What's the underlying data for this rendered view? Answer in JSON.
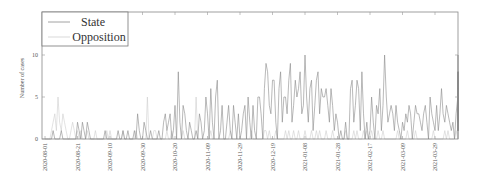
{
  "chart_data": {
    "type": "line",
    "title": "",
    "xlabel": "",
    "ylabel": "Number of cases",
    "ylim": [
      0,
      15
    ],
    "yticks": [
      0,
      5,
      10
    ],
    "grid": false,
    "legend_position": "upper left",
    "x_start": "2020-08-01",
    "x_end": "2021-04-13",
    "xtick_labels": [
      "2020-08-01",
      "2020-08-21",
      "2020-09-10",
      "2020-09-30",
      "2020-10-20",
      "2020-11-09",
      "2020-11-29",
      "2020-12-19",
      "2021-01-08",
      "2021-01-28",
      "2021-02-17",
      "2021-03-09",
      "2021-03-29"
    ],
    "series": [
      {
        "name": "State",
        "color": "#8a8a8a",
        "values": [
          0,
          0,
          0,
          0,
          0,
          1,
          0,
          0,
          0,
          0,
          1,
          0,
          0,
          0,
          0,
          0,
          0,
          0,
          0,
          0,
          2,
          1,
          0,
          2,
          1,
          0,
          2,
          1,
          0,
          0,
          0,
          0,
          0,
          0,
          0,
          0,
          0,
          1,
          0,
          0,
          0,
          0,
          0,
          0,
          0,
          1,
          0,
          0,
          1,
          0,
          0,
          1,
          0,
          0,
          0,
          1,
          0,
          3,
          1,
          0,
          0,
          2,
          1,
          0,
          0,
          1,
          0,
          0,
          0,
          0,
          1,
          0,
          0,
          2,
          3,
          1,
          2,
          3,
          0,
          1,
          4,
          0,
          8,
          2,
          0,
          4,
          3,
          1,
          0,
          2,
          1,
          0,
          0,
          1,
          0,
          3,
          2,
          0,
          1,
          5,
          3,
          0,
          6,
          2,
          0,
          5,
          7,
          0,
          1,
          4,
          0,
          0,
          2,
          4,
          1,
          0,
          4,
          2,
          0,
          3,
          0,
          1,
          3,
          4,
          0,
          5,
          2,
          0,
          4,
          1,
          0,
          5,
          5,
          3,
          0,
          6,
          9,
          8,
          4,
          3,
          7,
          7,
          2,
          0,
          6,
          8,
          2,
          5,
          5,
          3,
          7,
          9,
          2,
          4,
          7,
          5,
          6,
          8,
          3,
          4,
          10,
          5,
          2,
          6,
          7,
          1,
          4,
          7,
          8,
          3,
          6,
          5,
          5,
          6,
          4,
          2,
          6,
          4,
          1,
          3,
          2,
          0,
          1,
          0,
          0,
          2,
          0,
          0,
          6,
          7,
          2,
          4,
          7,
          6,
          1,
          8,
          3,
          0,
          2,
          0,
          1,
          5,
          2,
          0,
          4,
          3,
          6,
          1,
          4,
          10,
          5,
          2,
          3,
          4,
          3,
          1,
          4,
          2,
          1,
          0,
          2,
          1,
          3,
          2,
          4,
          3,
          0,
          2,
          4,
          3,
          3,
          2,
          1,
          3,
          4,
          2,
          0,
          5,
          3,
          2,
          1,
          4,
          1,
          3,
          6,
          3,
          2,
          4,
          3,
          2,
          1,
          2,
          0,
          3,
          5,
          4,
          3,
          1,
          7,
          10,
          2,
          8,
          4,
          1,
          6,
          5,
          7,
          1,
          4,
          8,
          2,
          1,
          7,
          4,
          2,
          6,
          8,
          2,
          5
        ],
        "notes": "Daily counts, approximate reading; darker gray line"
      },
      {
        "name": "Opposition",
        "color": "#cfcfcf",
        "values": [
          0,
          0,
          0,
          0,
          1,
          2,
          3,
          1,
          5,
          2,
          1,
          3,
          2,
          1,
          0,
          0,
          1,
          2,
          1,
          0,
          1,
          0,
          1,
          0,
          0,
          0,
          1,
          0,
          0,
          0,
          0,
          1,
          0,
          0,
          0,
          0,
          0,
          0,
          1,
          0,
          1,
          0,
          0,
          0,
          0,
          0,
          0,
          0,
          1,
          0,
          0,
          0,
          0,
          0,
          0,
          0,
          1,
          0,
          0,
          0,
          0,
          0,
          0,
          5,
          0,
          0,
          0,
          1,
          1,
          0,
          0,
          0,
          0,
          0,
          0,
          1,
          0,
          0,
          1,
          0,
          0,
          0,
          0,
          0,
          0,
          1,
          0,
          0,
          0,
          0,
          0,
          0,
          0,
          5,
          0,
          0,
          0,
          0,
          0,
          0,
          0,
          0,
          1,
          0,
          0,
          0,
          0,
          0,
          0,
          0,
          0,
          0,
          0,
          0,
          1,
          0,
          0,
          0,
          0,
          0,
          0,
          0,
          0,
          0,
          0,
          0,
          0,
          1,
          0,
          0,
          0,
          0,
          0,
          0,
          0,
          1,
          1,
          0,
          1,
          0,
          0,
          0,
          1,
          0,
          0,
          0,
          0,
          0,
          1,
          0,
          1,
          0,
          0,
          1,
          0,
          0,
          1,
          0,
          0,
          0,
          1,
          0,
          0,
          0,
          1,
          0,
          0,
          1,
          0,
          1,
          0,
          0,
          0,
          1,
          0,
          0,
          0,
          1,
          0,
          0,
          0,
          0,
          0,
          0,
          0,
          1,
          0,
          0,
          0,
          0,
          1,
          0,
          1,
          0,
          0,
          0,
          1,
          0,
          1,
          0,
          0,
          1,
          0,
          0,
          0,
          1,
          0,
          0,
          1,
          0,
          0,
          0,
          0,
          0,
          0,
          0,
          0,
          1,
          0,
          0,
          0,
          0,
          0,
          1,
          0,
          0,
          0,
          0,
          1,
          0,
          0,
          0,
          0,
          0,
          0,
          0,
          0,
          0,
          0,
          1,
          0,
          0,
          0,
          0,
          0,
          0,
          1,
          0,
          1,
          0,
          0,
          0,
          0,
          1,
          0,
          0,
          1,
          0,
          0,
          0,
          0,
          0,
          1,
          0,
          0,
          1,
          0,
          0,
          0,
          1,
          0,
          0,
          0,
          0,
          0,
          1,
          0,
          0,
          1,
          0,
          0,
          0
        ],
        "notes": "Daily counts, approximate reading; very light gray line"
      }
    ]
  },
  "legend": {
    "items": [
      {
        "label": "State",
        "color": "#8a8a8a"
      },
      {
        "label": "Opposition",
        "color": "#cfcfcf"
      }
    ]
  },
  "axes": {
    "ylabel": "Number of cases",
    "yticks": [
      "0",
      "5",
      "10"
    ],
    "xticks": [
      "2020-08-01",
      "2020-08-21",
      "2020-09-10",
      "2020-09-30",
      "2020-10-20",
      "2020-11-09",
      "2020-11-29",
      "2020-12-19",
      "2021-01-08",
      "2021-01-28",
      "2021-02-17",
      "2021-03-09",
      "2021-03-29"
    ]
  }
}
